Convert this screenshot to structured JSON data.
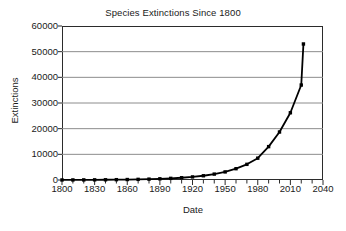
{
  "chart_data": {
    "type": "line",
    "title": "Species Extinctions Since 1800",
    "xlabel": "Date",
    "ylabel": "Extinctions",
    "xlim": [
      1800,
      2040
    ],
    "ylim": [
      0,
      60000
    ],
    "grid": "horizontal",
    "legend": "none",
    "marker": "filled-square",
    "line_color": "#000000",
    "gridline_color": "#8c8c8c",
    "frame_color": "#2b2b2b",
    "xticks": [
      1800,
      1830,
      1860,
      1890,
      1920,
      1950,
      1980,
      2010,
      2040
    ],
    "xtick_labels": [
      "1800",
      "1830",
      "1860",
      "1890",
      "1920",
      "1950",
      "1980",
      "2010",
      "2040"
    ],
    "xminor_tick_step": 10,
    "yticks": [
      0,
      10000,
      20000,
      30000,
      40000,
      50000,
      60000
    ],
    "ytick_labels": [
      "0",
      "10000",
      "20000",
      "30000",
      "40000",
      "50000",
      "60000"
    ],
    "x": [
      1800,
      1810,
      1820,
      1830,
      1840,
      1850,
      1860,
      1870,
      1880,
      1890,
      1900,
      1910,
      1920,
      1930,
      1940,
      1950,
      1960,
      1970,
      1980,
      1990,
      2000,
      2010,
      2020
    ],
    "values": [
      20,
      30,
      45,
      65,
      90,
      130,
      180,
      250,
      340,
      470,
      640,
      880,
      1200,
      1650,
      2300,
      3150,
      4400,
      6100,
      8500,
      13000,
      18700,
      26200,
      37000
    ],
    "series": [
      {
        "name": "Extinctions",
        "values": [
          20,
          30,
          45,
          65,
          90,
          130,
          180,
          250,
          340,
          470,
          640,
          880,
          1200,
          1650,
          2300,
          3150,
          4400,
          6100,
          8500,
          13000,
          18700,
          26200,
          37000
        ]
      }
    ],
    "final_point": {
      "x": 2022,
      "y": 53000
    }
  }
}
